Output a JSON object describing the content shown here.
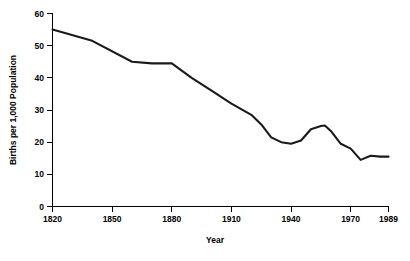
{
  "chart_data": {
    "type": "line",
    "title": "",
    "xlabel": "Year",
    "ylabel": "Births per 1,000 Population",
    "xlim": [
      1820,
      1989
    ],
    "ylim": [
      0,
      60
    ],
    "grid": false,
    "legend": "none",
    "x_ticks": [
      "1820",
      "1850",
      "1880",
      "1910",
      "1940",
      "1970",
      "1989"
    ],
    "x_tick_values": [
      1820,
      1850,
      1880,
      1910,
      1940,
      1970,
      1989
    ],
    "y_ticks": [
      "0",
      "10",
      "20",
      "30",
      "40",
      "50",
      "60"
    ],
    "y_tick_values": [
      0,
      10,
      20,
      30,
      40,
      50,
      60
    ],
    "series": [
      {
        "name": "Birth rate",
        "color": "#1a1a1a",
        "x": [
          1820,
          1840,
          1860,
          1870,
          1880,
          1890,
          1900,
          1910,
          1920,
          1925,
          1930,
          1935,
          1940,
          1945,
          1950,
          1955,
          1957,
          1960,
          1965,
          1970,
          1975,
          1980,
          1985,
          1989
        ],
        "values": [
          55.0,
          51.5,
          45.0,
          44.5,
          44.5,
          40.0,
          36.0,
          32.0,
          28.5,
          25.5,
          21.5,
          20.0,
          19.5,
          20.5,
          24.0,
          25.0,
          25.2,
          23.5,
          19.5,
          18.0,
          14.5,
          15.8,
          15.5,
          15.5
        ]
      }
    ],
    "annotations": []
  },
  "axes": {
    "x_axis_name": "Year",
    "y_axis_name": "Births per 1,000 Population"
  }
}
